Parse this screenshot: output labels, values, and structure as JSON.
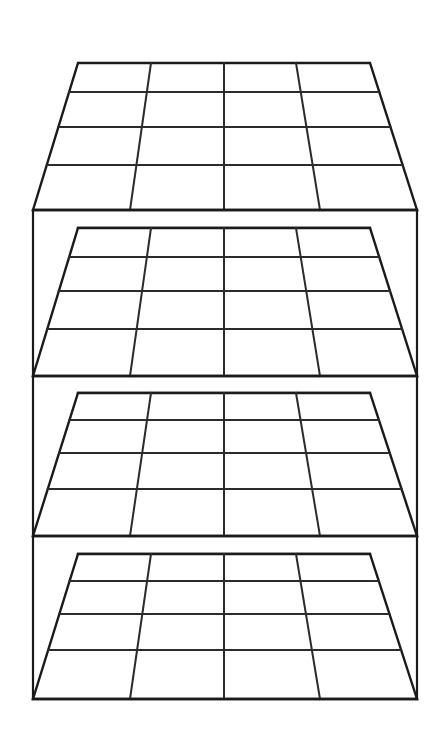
{
  "document": {
    "title": "Shelving Unit Perspective Line Drawing",
    "kind": "line-drawing",
    "background_color": "#ffffff",
    "line_color": "#1a1a1a",
    "canvas": {
      "width": 441,
      "height": 746
    }
  },
  "object": {
    "name": "shelving-unit",
    "description": "Four-tier open shelving unit drawn in one-point perspective, viewed slightly from above, each shelf surface divided into a 4 by 4 grid of compartment cells.",
    "shelf_count": 4,
    "columns_per_shelf": 4,
    "rows_per_shelf": 4,
    "total_cells": 64,
    "view": "one-point perspective, eye level above top shelf"
  },
  "frame": {
    "left_post_x": 33,
    "right_post_x": 417,
    "top_y": 210,
    "bottom_y": 699,
    "stroke_width": 2.2
  },
  "vanishing": {
    "x": 224,
    "y": -420
  },
  "shelves": [
    {
      "id": "shelf-1",
      "label": "Top shelf",
      "back_left": {
        "x": 78,
        "y": 63
      },
      "back_right": {
        "x": 370,
        "y": 63
      },
      "front_left": {
        "x": 33,
        "y": 210
      },
      "front_right": {
        "x": 417,
        "y": 210
      },
      "row_ys": [
        63,
        92,
        127,
        165,
        210
      ],
      "back_col_xs": [
        78,
        151,
        224,
        296,
        370
      ],
      "front_col_xs": [
        33,
        130,
        224,
        320,
        417
      ],
      "band_top_y": 210,
      "band_bottom_y": 228
    },
    {
      "id": "shelf-2",
      "label": "Second shelf",
      "back_left": {
        "x": 78,
        "y": 228
      },
      "back_right": {
        "x": 370,
        "y": 228
      },
      "front_left": {
        "x": 33,
        "y": 376
      },
      "front_right": {
        "x": 417,
        "y": 376
      },
      "row_ys": [
        228,
        257,
        291,
        329,
        376
      ],
      "back_col_xs": [
        78,
        151,
        224,
        296,
        370
      ],
      "front_col_xs": [
        33,
        130,
        224,
        320,
        417
      ],
      "band_top_y": 376,
      "band_bottom_y": 393
    },
    {
      "id": "shelf-3",
      "label": "Third shelf",
      "back_left": {
        "x": 78,
        "y": 393
      },
      "back_right": {
        "x": 370,
        "y": 393
      },
      "front_left": {
        "x": 33,
        "y": 536
      },
      "front_right": {
        "x": 417,
        "y": 536
      },
      "row_ys": [
        393,
        420,
        453,
        489,
        536
      ],
      "back_col_xs": [
        78,
        151,
        224,
        296,
        370
      ],
      "front_col_xs": [
        33,
        130,
        224,
        320,
        417
      ],
      "band_top_y": 536,
      "band_bottom_y": 554
    },
    {
      "id": "shelf-4",
      "label": "Bottom shelf",
      "back_left": {
        "x": 78,
        "y": 554
      },
      "back_right": {
        "x": 370,
        "y": 554
      },
      "front_left": {
        "x": 33,
        "y": 699
      },
      "front_right": {
        "x": 417,
        "y": 699
      },
      "row_ys": [
        554,
        581,
        614,
        650,
        699
      ],
      "back_col_xs": [
        78,
        151,
        224,
        296,
        370
      ],
      "front_col_xs": [
        33,
        130,
        224,
        320,
        417
      ],
      "band_top_y": 699,
      "band_bottom_y": 699
    }
  ],
  "strokes": {
    "outline_width": 2.4,
    "grid_width": 2.0,
    "color": "#1a1a1a",
    "grid_color": "#2b2b2b"
  }
}
